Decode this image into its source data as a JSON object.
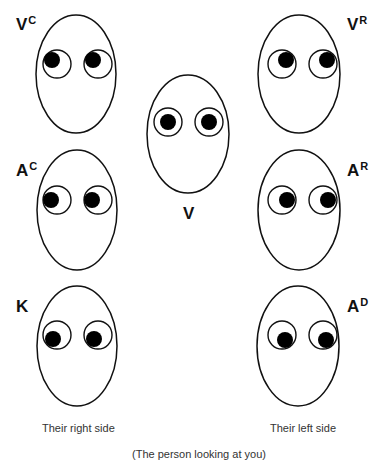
{
  "diagram": {
    "colors": {
      "outline": "#111111",
      "pupil": "#000000",
      "background": "#ffffff",
      "text": "#111111",
      "caption": "#333333"
    },
    "faces": [
      {
        "id": "VC",
        "label_main": "V",
        "label_sup": "C",
        "cx": 76,
        "cy": 74,
        "rx": 40,
        "ry": 59,
        "eyes": [
          {
            "cx": 57,
            "cy": 64
          },
          {
            "cx": 98,
            "cy": 64
          }
        ],
        "gaze": "up-left (their right)",
        "pupil_offset": {
          "dx": -5,
          "dy": -4
        }
      },
      {
        "id": "V",
        "label_main": "V",
        "label_sup": "",
        "cx": 188,
        "cy": 134,
        "rx": 41,
        "ry": 59,
        "eyes": [
          {
            "cx": 168,
            "cy": 122
          },
          {
            "cx": 209,
            "cy": 122
          }
        ],
        "gaze": "straight ahead",
        "pupil_offset": {
          "dx": 0,
          "dy": 0
        }
      },
      {
        "id": "VR",
        "label_main": "V",
        "label_sup": "R",
        "cx": 299,
        "cy": 74,
        "rx": 41,
        "ry": 59,
        "eyes": [
          {
            "cx": 282,
            "cy": 64
          },
          {
            "cx": 323,
            "cy": 64
          }
        ],
        "gaze": "up-right (their left)",
        "pupil_offset": {
          "dx": 4,
          "dy": -4
        }
      },
      {
        "id": "AC",
        "label_main": "A",
        "label_sup": "C",
        "cx": 77,
        "cy": 210,
        "rx": 40,
        "ry": 60,
        "eyes": [
          {
            "cx": 57,
            "cy": 200
          },
          {
            "cx": 98,
            "cy": 200
          }
        ],
        "gaze": "left (their right)",
        "pupil_offset": {
          "dx": -6,
          "dy": 0
        }
      },
      {
        "id": "AR",
        "label_main": "A",
        "label_sup": "R",
        "cx": 299,
        "cy": 210,
        "rx": 41,
        "ry": 60,
        "eyes": [
          {
            "cx": 282,
            "cy": 200
          },
          {
            "cx": 323,
            "cy": 200
          }
        ],
        "gaze": "right (their left)",
        "pupil_offset": {
          "dx": 5,
          "dy": 0
        }
      },
      {
        "id": "K",
        "label_main": "K",
        "label_sup": "",
        "cx": 77,
        "cy": 346,
        "rx": 40,
        "ry": 60,
        "eyes": [
          {
            "cx": 57,
            "cy": 335
          },
          {
            "cx": 98,
            "cy": 335
          }
        ],
        "gaze": "down-left (their right)",
        "pupil_offset": {
          "dx": -4,
          "dy": 4
        }
      },
      {
        "id": "AD",
        "label_main": "A",
        "label_sup": "D",
        "cx": 298,
        "cy": 346,
        "rx": 41,
        "ry": 60,
        "eyes": [
          {
            "cx": 282,
            "cy": 335
          },
          {
            "cx": 323,
            "cy": 335
          }
        ],
        "gaze": "down-right (their left)",
        "pupil_offset": {
          "dx": 3,
          "dy": 5
        }
      }
    ],
    "eye_radius": 14,
    "pupil_radius": 8,
    "labels": {
      "VC": {
        "main": "V",
        "sup": "C"
      },
      "VR": {
        "main": "V",
        "sup": "R"
      },
      "V": {
        "main": "V"
      },
      "AC": {
        "main": "A",
        "sup": "C"
      },
      "AR": {
        "main": "A",
        "sup": "R"
      },
      "K": {
        "main": "K"
      },
      "AD": {
        "main": "A",
        "sup": "D"
      }
    },
    "captions": {
      "left": "Their right side",
      "right": "Their left side",
      "bottom": "(The person looking at you)"
    }
  }
}
